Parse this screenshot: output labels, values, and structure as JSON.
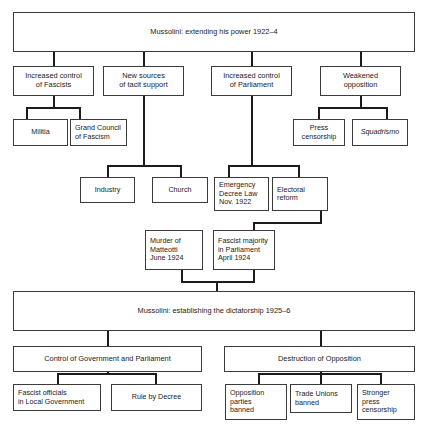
{
  "diagram": {
    "title": "Mussolini: extending his power 1922–4",
    "type": "flowchart",
    "tiers": {
      "top_banner": "Mussolini: extending his power 1922–4",
      "mid_banner": "Mussolini: establishing the dictatorship 1925–6"
    },
    "nodes": {
      "banner1": "Mussolini: extending his power 1922–4",
      "increased_control_fascists": "Increased control\nof Fascists",
      "new_sources_tacit_support": "New sources\nof tacit support",
      "increased_control_parliament": "Increased control\nof Parliament",
      "weakened_opposition": "Weakened\nopposition",
      "militia": "Militia",
      "grand_council": "Grand Council\nof Fascism",
      "press_censorship": "Press\ncensorship",
      "squadrismo": "Squadrismo",
      "industry": "Industry",
      "church": "Church",
      "emergency_decree_law": "Emergency\nDecree Law\nNov. 1922",
      "electoral_reform": "Electoral\nreform",
      "murder_of_matteotti": "Murder of\nMatteotti\nJune 1924",
      "fascist_majority": "Fascist majority\nin Parliament\nApril 1924",
      "banner2": "Mussolini: establishing the dictatorship 1925–6",
      "control_of_government": "Control of Government and Parliament",
      "destruction_of_opposition": "Destruction of Opposition",
      "fascist_officials": "Fascist officials\nin Local Government",
      "rule_by_decree": "Rule by Decree",
      "opposition_parties_banned": "Opposition\nparties\nbanned",
      "trade_unions_banned": "Trade Unions\nbanned",
      "stronger_press_censorship": "Stronger\npress\ncensorship"
    },
    "colors": {
      "border": "#3b3b3b",
      "connector": "#1c1c1c",
      "background": "#ffffff",
      "text": "#1a1a1a"
    }
  }
}
